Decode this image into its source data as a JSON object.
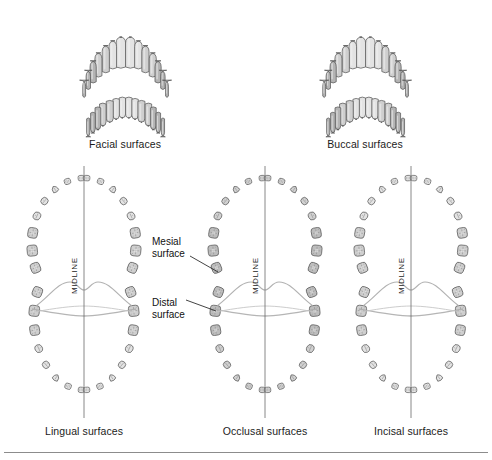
{
  "figure": {
    "background": "#ffffff",
    "rule_color": "#8c8c8c"
  },
  "palette": {
    "tooth_fill_light": "#e3e3e3",
    "tooth_fill_mid": "#cfcfcf",
    "tooth_fill_dark": "#b4b4b4",
    "tooth_outline": "#5a5a5a",
    "tooth_detail": "#8a8a8a",
    "midline_color": "#6b6b6b",
    "tissue_curve": "#a8a8a8",
    "leader_color": "#222222",
    "text_color": "#1b1b1b"
  },
  "top_views": [
    {
      "id": "facial",
      "label": "Facial surfaces",
      "label_x": 125,
      "label_y": 138,
      "arch_upper": {
        "teeth": 14,
        "cx": 125,
        "cy": 52
      },
      "arch_lower": {
        "teeth": 14,
        "cx": 125,
        "cy": 108
      }
    },
    {
      "id": "buccal",
      "label": "Buccal surfaces",
      "label_x": 365,
      "label_y": 138,
      "arch_upper": {
        "teeth": 14,
        "cx": 365,
        "cy": 52
      },
      "arch_lower": {
        "teeth": 14,
        "cx": 365,
        "cy": 108
      }
    }
  ],
  "arch_views": [
    {
      "id": "lingual",
      "label": "Lingual surfaces",
      "label_x": 84,
      "label_y": 432,
      "cx": 84,
      "midline_label": "MIDLINE",
      "midline_label_x": 79,
      "midline_label_y": 285,
      "teeth_per_quadrant": 8,
      "quadrants": 4,
      "total_teeth": 32
    },
    {
      "id": "occlusal",
      "label": "Occlusal surfaces",
      "label_x": 265,
      "label_y": 432,
      "cx": 265,
      "midline_label": "MIDLINE",
      "midline_label_x": 260,
      "midline_label_y": 285,
      "teeth_per_quadrant": 8,
      "quadrants": 4,
      "total_teeth": 32
    },
    {
      "id": "incisal",
      "label": "Incisal surfaces",
      "label_x": 411,
      "label_y": 432,
      "cx": 411,
      "midline_label": "MIDLINE",
      "midline_label_x": 406,
      "midline_label_y": 285,
      "teeth_per_quadrant": 8,
      "quadrants": 4,
      "total_teeth": 32
    }
  ],
  "annotations": [
    {
      "id": "mesial",
      "line1": "Mesial",
      "line2": "surface",
      "x": 152,
      "y": 236,
      "leader": {
        "x1": 190,
        "y1": 256,
        "x2": 218,
        "y2": 272
      }
    },
    {
      "id": "distal",
      "line1": "Distal",
      "line2": "surface",
      "x": 152,
      "y": 297,
      "leader": {
        "x1": 186,
        "y1": 300,
        "x2": 216,
        "y2": 311
      }
    }
  ],
  "footer_rule": {
    "y": 452
  }
}
